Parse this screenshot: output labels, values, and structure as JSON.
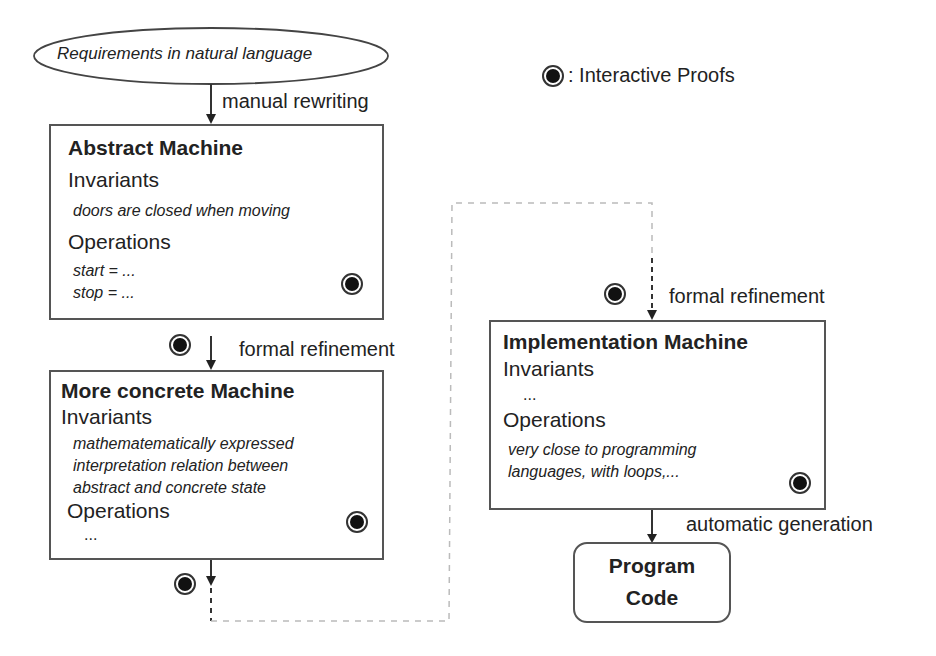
{
  "requirements": {
    "label": "Requirements in natural language"
  },
  "legend": {
    "icon": "interactive-proof-icon",
    "label": ": Interactive Proofs"
  },
  "arrows": {
    "manual": "manual rewriting",
    "refine1": "formal refinement",
    "refine2": "formal refinement",
    "generation": "automatic generation"
  },
  "abstract_machine": {
    "title": "Abstract Machine",
    "invariants_label": "Invariants",
    "invariants": [
      "doors are closed when moving"
    ],
    "operations_label": "Operations",
    "operations": [
      "start = ...",
      "stop = ..."
    ]
  },
  "concrete_machine": {
    "title": "More concrete Machine",
    "invariants_label": "Invariants",
    "invariants": [
      "mathematematically expressed",
      "interpretation relation between",
      "abstract and concrete state"
    ],
    "operations_label": "Operations",
    "operations": [
      "..."
    ]
  },
  "implementation_machine": {
    "title": "Implementation Machine",
    "invariants_label": "Invariants",
    "invariants": [
      "..."
    ],
    "operations_label": "Operations",
    "operations": [
      "very close to programming",
      "languages, with loops,..."
    ]
  },
  "program_code": {
    "line1": "Program",
    "line2": "Code"
  },
  "colors": {
    "line": "#333333",
    "dashed_light": "#bbbbbb",
    "proof_fill": "#111111"
  }
}
